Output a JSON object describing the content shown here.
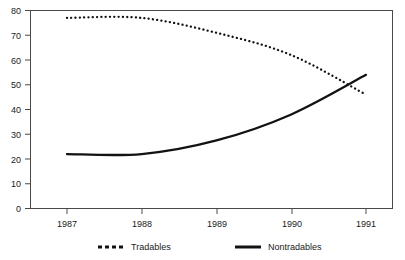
{
  "chart_data": {
    "type": "line",
    "title": "",
    "subtitle": "",
    "xlabel": "",
    "ylabel": "",
    "x": [
      1987,
      1988,
      1989,
      1990,
      1991
    ],
    "categories": [
      "1987",
      "1988",
      "1989",
      "1990",
      "1991"
    ],
    "xlim": [
      1987,
      1991
    ],
    "ylim": [
      0,
      80
    ],
    "yticks": [
      0,
      10,
      20,
      30,
      40,
      50,
      60,
      70,
      80
    ],
    "ytick_labels": [
      "0",
      "10",
      "20",
      "30",
      "40",
      "50",
      "60",
      "70",
      "80"
    ],
    "xticks": [
      1987,
      1988,
      1989,
      1990,
      1991
    ],
    "xtick_labels": [
      "1987",
      "1988",
      "1989",
      "1990",
      "1991"
    ],
    "grid": false,
    "legend_position": "bottom",
    "series": [
      {
        "name": "Tradables",
        "style": "dotted",
        "color": "#121212",
        "values": [
          77,
          77,
          71,
          62,
          46
        ]
      },
      {
        "name": "Nontradables",
        "style": "solid",
        "color": "#121212",
        "values": [
          22,
          22,
          27.5,
          38,
          54
        ]
      }
    ]
  },
  "legend": {
    "items": [
      {
        "label": "Tradables",
        "style": "dotted"
      },
      {
        "label": "Nontradables",
        "style": "solid"
      }
    ]
  },
  "axes": {
    "y_tick_labels": [
      "80",
      "70",
      "60",
      "50",
      "40",
      "30",
      "20",
      "10",
      "0"
    ],
    "x_tick_labels": [
      "1987",
      "1988",
      "1989",
      "1990",
      "1991"
    ]
  }
}
